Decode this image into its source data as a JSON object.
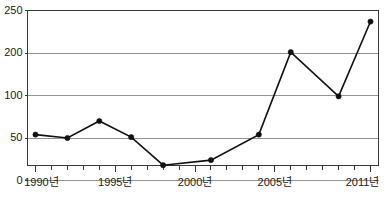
{
  "chart_data": {
    "type": "line",
    "title": "",
    "subtitle": "",
    "xlabel": "",
    "ylabel": "",
    "grid": true,
    "legend": false,
    "legend_position": "none",
    "x": [
      1990,
      1992,
      1994,
      1996,
      1998,
      2001,
      2004,
      2006,
      2009,
      2011
    ],
    "values": [
      54,
      50,
      70,
      51,
      18,
      24,
      54,
      201,
      99,
      237
    ],
    "series": [
      {
        "name": "series-1",
        "values": [
          54,
          50,
          70,
          51,
          18,
          24,
          54,
          201,
          99,
          237
        ]
      }
    ],
    "points": [
      {
        "x": 1990,
        "y": 54
      },
      {
        "x": 1992,
        "y": 50
      },
      {
        "x": 1994,
        "y": 70
      },
      {
        "x": 1996,
        "y": 51
      },
      {
        "x": 1998,
        "y": 18
      },
      {
        "x": 2001,
        "y": 24
      },
      {
        "x": 2004,
        "y": 54
      },
      {
        "x": 2006,
        "y": 201
      },
      {
        "x": 2009,
        "y": 99
      },
      {
        "x": 2011,
        "y": 237
      }
    ],
    "ytick_labels": [
      "250",
      "200",
      "100",
      "50",
      "0"
    ],
    "ytick_values": [
      250,
      200,
      100,
      50,
      0
    ],
    "ylim": [
      0,
      250
    ],
    "xlim": [
      1990,
      2011
    ],
    "xtick_labels": [
      "1990년",
      "1995년",
      "2000년",
      "2005년",
      "2011년"
    ],
    "xtick_values": [
      1990,
      1995,
      2000,
      2005,
      2011
    ],
    "xminor_tick_values": [
      1991,
      1992,
      1993,
      1994,
      1996,
      1997,
      1998,
      1999,
      2001,
      2002,
      2003,
      2004,
      2006,
      2007,
      2008,
      2009,
      2010
    ],
    "colors": {
      "line": "#111111",
      "marker": "#111111",
      "grid": "#8a8a8a",
      "frame": "#3a3a3a",
      "text": "#1a1a1a",
      "background": "#ffffff"
    }
  }
}
